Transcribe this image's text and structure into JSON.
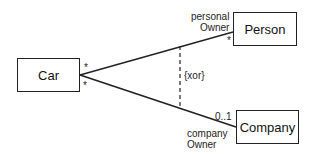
{
  "diagram": {
    "classes": {
      "car": "Car",
      "person": "Person",
      "company": "Company"
    },
    "associations": {
      "person": {
        "role_line1": "personal",
        "role_line2": "Owner",
        "car_end_multiplicity": "*",
        "person_end_multiplicity": "*"
      },
      "company": {
        "role_line1": "company",
        "role_line2": "Owner",
        "car_end_multiplicity": "*",
        "company_end_multiplicity": "0..1"
      }
    },
    "constraint": "{xor}",
    "colors": {
      "stroke": "#222222",
      "background": "#ffffff"
    }
  }
}
